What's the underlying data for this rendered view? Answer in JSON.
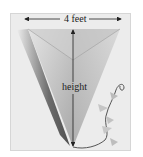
{
  "diagram": {
    "labels": {
      "width": "4 feet",
      "height": "height"
    },
    "colors": {
      "background": "#ececec",
      "kite_light": "#d9d9d9",
      "kite_mid": "#bdbdbd",
      "kite_dark": "#9a9a9a",
      "shadow": "#444444",
      "arrow": "#222222",
      "tail": "#555555"
    }
  }
}
